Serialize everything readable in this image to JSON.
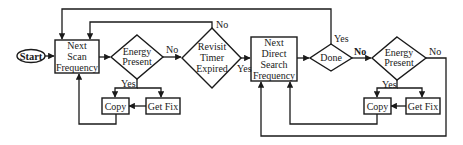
{
  "diagram": {
    "type": "flowchart",
    "nodes": {
      "start": {
        "label": "Start",
        "shape": "oval"
      },
      "next_scan": {
        "shape": "process",
        "lines": [
          "Next",
          "Scan",
          "Frequency"
        ]
      },
      "energy1": {
        "shape": "decision",
        "lines": [
          "Energy",
          "Present"
        ]
      },
      "revisit": {
        "shape": "decision",
        "lines": [
          "Revisit",
          "Timer",
          "Expired"
        ]
      },
      "next_direct": {
        "shape": "process",
        "lines": [
          "Next",
          "Direct",
          "Search",
          "Frequency"
        ]
      },
      "done": {
        "shape": "decision",
        "lines": [
          "Done"
        ]
      },
      "energy2": {
        "shape": "decision",
        "lines": [
          "Energy",
          "Present"
        ]
      },
      "copy1": {
        "shape": "process",
        "label": "Copy"
      },
      "getfix1": {
        "shape": "process",
        "label": "Get Fix"
      },
      "copy2": {
        "shape": "process",
        "label": "Copy"
      },
      "getfix2": {
        "shape": "process",
        "label": "Get Fix"
      }
    },
    "edge_labels": {
      "energy1_no": "No",
      "energy1_yes": "Yes",
      "revisit_no": "No",
      "revisit_yes": "Yes",
      "done_yes": "Yes",
      "done_no": "No",
      "energy2_no": "No",
      "energy2_yes": "Yes"
    },
    "edges": [
      {
        "from": "Start",
        "to": "Next Scan Frequency"
      },
      {
        "from": "Next Scan Frequency",
        "to": "Energy Present (1)"
      },
      {
        "from": "Energy Present (1)",
        "to": "Revisit Timer Expired",
        "label": "No"
      },
      {
        "from": "Energy Present (1)",
        "to": "Copy (1)",
        "label": "Yes"
      },
      {
        "from": "Energy Present (1)",
        "to": "Get Fix (1)",
        "label": "Yes"
      },
      {
        "from": "Get Fix (1)",
        "to": "Copy (1)"
      },
      {
        "from": "Copy (1)",
        "to": "Next Scan Frequency"
      },
      {
        "from": "Revisit Timer Expired",
        "to": "Next Scan Frequency",
        "label": "No"
      },
      {
        "from": "Revisit Timer Expired",
        "to": "Next Direct Search Frequency",
        "label": "Yes"
      },
      {
        "from": "Next Direct Search Frequency",
        "to": "Done"
      },
      {
        "from": "Done",
        "to": "Next Scan Frequency",
        "label": "Yes"
      },
      {
        "from": "Done",
        "to": "Energy Present (2)",
        "label": "No"
      },
      {
        "from": "Energy Present (2)",
        "to": "Copy (2)",
        "label": "Yes"
      },
      {
        "from": "Energy Present (2)",
        "to": "Get Fix (2)",
        "label": "Yes"
      },
      {
        "from": "Get Fix (2)",
        "to": "Copy (2)"
      },
      {
        "from": "Copy (2)",
        "to": "Next Direct Search Frequency"
      },
      {
        "from": "Energy Present (2)",
        "to": "Next Direct Search Frequency",
        "label": "No"
      }
    ]
  }
}
